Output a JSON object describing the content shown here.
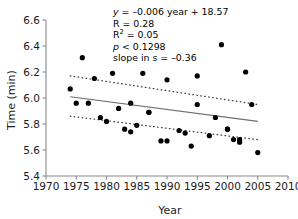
{
  "chart_data": {
    "type": "scatter",
    "title": "",
    "xlabel": "Year",
    "ylabel": "Time (min)",
    "xlim": [
      1970,
      2010
    ],
    "ylim": [
      5.4,
      6.6
    ],
    "xticks": [
      1970,
      1975,
      1980,
      1985,
      1990,
      1995,
      2000,
      2005,
      2010
    ],
    "yticks": [
      "5.4",
      "5.6",
      "5.8",
      "6.0",
      "6.2",
      "6.4",
      "6.6"
    ],
    "grid": false,
    "legend": "none",
    "point_color": "#000000",
    "fit_line_color": "#6e6e6e",
    "ci_band_color": "#3a3a3a",
    "x": [
      1974,
      1975,
      1976,
      1977,
      1978,
      1979,
      1980,
      1981,
      1982,
      1983,
      1984,
      1984,
      1985,
      1986,
      1987,
      1987,
      1989,
      1990,
      1990,
      1992,
      1993,
      1994,
      1995,
      1995,
      1997,
      1998,
      1999,
      2000,
      2000,
      2001,
      2002,
      2002,
      2003,
      2004,
      2005
    ],
    "y": [
      6.07,
      5.96,
      6.31,
      5.96,
      6.15,
      5.85,
      5.82,
      6.19,
      5.92,
      5.76,
      5.96,
      5.74,
      5.79,
      6.19,
      5.89,
      5.89,
      5.67,
      6.14,
      5.67,
      5.75,
      5.73,
      5.63,
      6.17,
      5.95,
      5.71,
      5.85,
      6.41,
      5.76,
      5.76,
      5.68,
      5.66,
      5.68,
      6.2,
      5.95,
      5.58
    ],
    "fit_line": {
      "x": [
        1974,
        2005
      ],
      "y": [
        6.01,
        5.82
      ]
    },
    "ci_upper": {
      "x": [
        1974,
        2005
      ],
      "y": [
        6.17,
        5.95
      ]
    },
    "ci_lower": {
      "x": [
        1974,
        2005
      ],
      "y": [
        5.86,
        5.68
      ]
    },
    "annotations": {
      "equation_prefix": "y",
      "equation_body": " = –0.006 year + 18.57",
      "r_line": "R = 0.28",
      "r2_prefix": "R",
      "r2_sup": "2",
      "r2_suffix": " = 0.05",
      "p_prefix": "p",
      "p_suffix": " < 0.1298",
      "slope_line": "slope in s = –0.36"
    }
  }
}
